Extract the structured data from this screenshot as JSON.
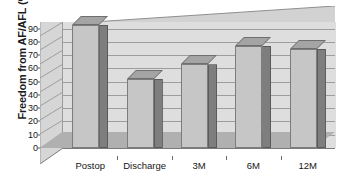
{
  "chart_data": {
    "type": "bar",
    "title": "",
    "subtitle": "",
    "xlabel": "",
    "ylabel": "Freedom from AF/AFL (%)",
    "categories": [
      "Postop",
      "Discharge",
      "3M",
      "6M",
      "12M"
    ],
    "values": [
      93,
      52,
      63,
      77,
      75
    ],
    "ylim": [
      0,
      95
    ],
    "yticks": [
      0,
      10,
      20,
      30,
      40,
      50,
      60,
      70,
      80,
      90
    ],
    "ytick_labels": [
      "0",
      "10",
      "20",
      "30",
      "40",
      "50",
      "60",
      "70",
      "80",
      "90"
    ],
    "grid": true,
    "grid_axis": "y",
    "legend": false,
    "legend_position": "none",
    "style": "3d-column",
    "annotations": [],
    "series": [
      {
        "name": "Freedom from AF/AFL",
        "values": [
          93,
          52,
          63,
          77,
          75
        ]
      }
    ]
  },
  "colors": {
    "bar_front": "#c6c6c6",
    "bar_side": "#7e7e7e",
    "bar_top": "#a4a4a4",
    "bar_outline": "#7c7c7c",
    "back_wall": "#dedede",
    "left_wall": "#d6d6d6",
    "ceiling": "#d2d2d2",
    "floor": "#b0b0b0",
    "gridline": "#9d9d9d",
    "text": "#151515",
    "background": "#ffffff"
  }
}
